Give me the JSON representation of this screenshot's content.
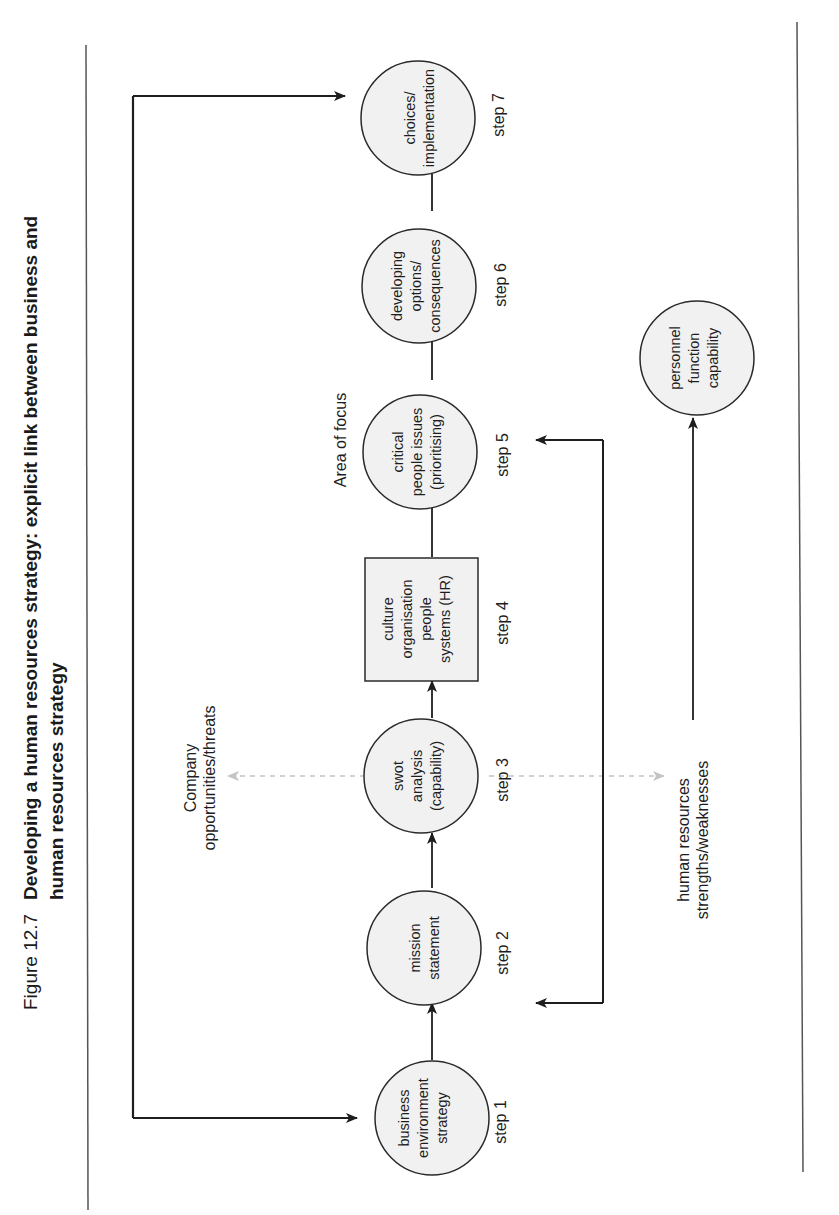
{
  "figure": {
    "number": "Figure 12.7",
    "title_line1": "Developing a human resources strategy: explicit link between business and",
    "title_line2": "human resources strategy",
    "orientation": "rotated 90° counter-clockwise"
  },
  "steps": [
    {
      "id": 1,
      "label": "step 1",
      "shape": "circle",
      "lines": [
        "business",
        "environment",
        "strategy"
      ]
    },
    {
      "id": 2,
      "label": "step 2",
      "shape": "circle",
      "lines": [
        "mission",
        "statement"
      ]
    },
    {
      "id": 3,
      "label": "step 3",
      "shape": "circle",
      "lines": [
        "swot",
        "analysis",
        "(capability)"
      ]
    },
    {
      "id": 4,
      "label": "step 4",
      "shape": "box",
      "lines": [
        "culture",
        "organisation",
        "people",
        "systems (HR)"
      ]
    },
    {
      "id": 5,
      "label": "step 5",
      "shape": "circle",
      "lines": [
        "critical",
        "people issues",
        "(prioritising)"
      ]
    },
    {
      "id": 6,
      "label": "step 6",
      "shape": "circle",
      "lines": [
        "developing",
        "options/",
        "consequences"
      ]
    },
    {
      "id": 7,
      "label": "step 7",
      "shape": "circle",
      "lines": [
        "choices/",
        "implementation"
      ]
    }
  ],
  "side_nodes": {
    "personnel": {
      "lines": [
        "personnel",
        "function",
        "capability"
      ]
    }
  },
  "labels": {
    "area_of_focus": "Area of focus",
    "company_line1": "Company",
    "company_line2": "opportunities/threats",
    "hr_line1": "human resources",
    "hr_line2": "strengths/weaknesses"
  },
  "colors": {
    "node_fill": "#f1f1f1",
    "stroke": "#2a2a2a",
    "dashed": "#bdbdbd",
    "rule": "#555555"
  }
}
